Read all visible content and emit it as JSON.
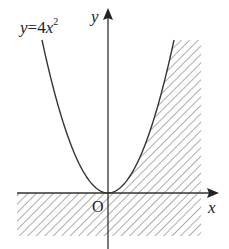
{
  "diagram": {
    "type": "function-graph-region",
    "curve_label": {
      "var": "y",
      "eq": "=",
      "coef": "4",
      "base": "x",
      "exp": "2"
    },
    "function": {
      "a": 4,
      "power": 2
    },
    "axes": {
      "x_label": "x",
      "y_label": "y",
      "origin_label": "O"
    },
    "shaded_regions": [
      "right of parabola, above x-axis, x >= 0",
      "below x-axis"
    ],
    "colors": {
      "line": "#333333",
      "hatch": "#888888",
      "text": "#222222"
    }
  }
}
